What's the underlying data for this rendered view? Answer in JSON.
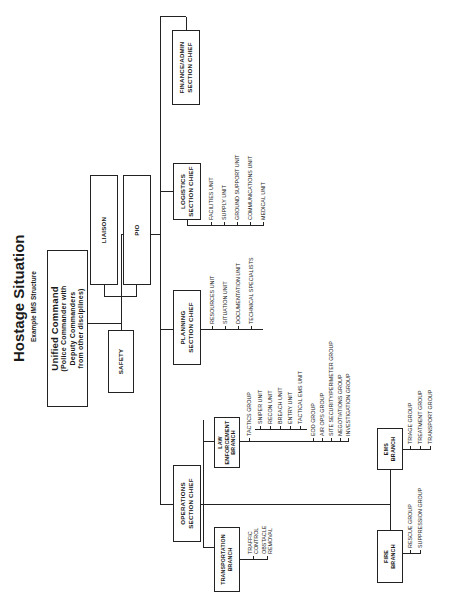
{
  "title": "Hostage Situation",
  "subtitle": "Example IMS Structure",
  "command": {
    "unified_command": {
      "title": "Unified Command",
      "lines": [
        "(Police Commander with",
        "Deputy Commanders",
        "from other disciplines)"
      ]
    },
    "staff": {
      "liaison": "LIAISON",
      "pio": "PIO",
      "safety": "SAFETY"
    }
  },
  "sections": {
    "operations": {
      "label_line1": "OPERATIONS",
      "label_line2": "SECTION CHIEF",
      "branches": {
        "transportation": {
          "label_line1": "TRANSPORTATION",
          "label_line2": "BRANCH",
          "items": [
            {
              "line1": "TRAFFIC",
              "line2": "CONTROL"
            },
            {
              "line1": "OBSTACLE",
              "line2": "REMOVAL"
            }
          ]
        },
        "law_enforcement": {
          "label_line1": "LAW",
          "label_line2": "ENFORCEMENT",
          "label_line3": "BRANCH",
          "tactics_group": "TACTICS GROUP",
          "tactics_units": [
            "SNIPER UNIT",
            "RECON UNIT",
            "BREACH UNIT",
            "ENTRY UNIT",
            "TACTICAL EMS UNIT"
          ],
          "groups": [
            "EOD GROUP",
            "AIR OPS GROUP",
            "SITE SECURITY/PERIMETER GROUP",
            "NEGOTIATIONS GROUP",
            "INVESTIGATION GROUP"
          ]
        },
        "ems": {
          "label_line1": "EMS",
          "label_line2": "BRANCH",
          "groups": [
            "TRIAGE GROUP",
            "TREATMENT GROUP",
            "TRANSPORT GROUP"
          ]
        },
        "fire": {
          "label_line1": "FIRE",
          "label_line2": "BRANCH",
          "groups": [
            "RESCUE GROUP",
            "SUPPRESSION GROUP"
          ]
        }
      }
    },
    "planning": {
      "label_line1": "PLANNING",
      "label_line2": "SECTION CHIEF",
      "units": [
        "RESOURCES UNIT",
        "SITUATION UNIT",
        "DOCUMENTATION UNIT",
        "TECHNICAL SPECIALISTS"
      ]
    },
    "logistics": {
      "label_line1": "LOGISTICS",
      "label_line2": "SECTION CHIEF",
      "units": [
        "FACILITIES UNIT",
        "SUPPLY UNIT",
        "GROUND SUPPORT UNIT",
        "COMMUNICATIONS UNIT",
        "MEDICAL UNIT"
      ]
    },
    "finance": {
      "label_line1": "FINANCE/ADMIN",
      "label_line2": "SECTION CHIEF"
    }
  }
}
